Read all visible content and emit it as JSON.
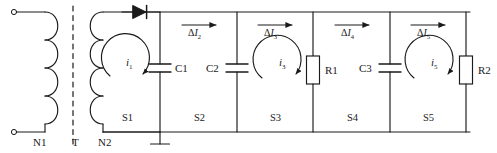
{
  "diagram": {
    "stroke_color": "#1a1a1a",
    "terminals": [
      {
        "name": "primary-winding-label",
        "text": "N1",
        "x": 33,
        "y": 136
      },
      {
        "name": "transformer-core-label",
        "text": "T",
        "x": 72,
        "y": 136
      },
      {
        "name": "secondary-winding-label",
        "text": "N2",
        "x": 98,
        "y": 136
      }
    ],
    "components": [
      {
        "name": "capacitor-c1",
        "text": "C1",
        "x": 175,
        "y": 64
      },
      {
        "name": "capacitor-c2",
        "text": "C2",
        "x": 208,
        "y": 64
      },
      {
        "name": "resistor-r1",
        "text": "R1",
        "x": 327,
        "y": 68
      },
      {
        "name": "capacitor-c3",
        "text": "C3",
        "x": 362,
        "y": 64
      },
      {
        "name": "resistor-r2",
        "text": "R2",
        "x": 478,
        "y": 68
      }
    ],
    "sections": [
      {
        "name": "section-s1",
        "text": "S1",
        "x": 122,
        "y": 114
      },
      {
        "name": "section-s2",
        "text": "S2",
        "x": 196,
        "y": 114
      },
      {
        "name": "section-s3",
        "text": "S3",
        "x": 272,
        "y": 114
      },
      {
        "name": "section-s4",
        "text": "S4",
        "x": 348,
        "y": 114
      },
      {
        "name": "section-s5",
        "text": "S5",
        "x": 425,
        "y": 114
      }
    ],
    "loop_currents": [
      {
        "name": "loop-current-i1",
        "symbol": "i",
        "subscript": "1",
        "x": 127,
        "y": 62
      },
      {
        "name": "loop-current-i3",
        "symbol": "i",
        "subscript": "3",
        "x": 280,
        "y": 62
      },
      {
        "name": "loop-current-i5",
        "symbol": "i",
        "subscript": "5",
        "x": 432,
        "y": 62
      }
    ],
    "delta_currents": [
      {
        "name": "delta-current-i2",
        "prefix": "Δ",
        "symbol": "I",
        "subscript": "2",
        "x": 199,
        "y": 27
      },
      {
        "name": "delta-current-i3",
        "prefix": "Δ",
        "symbol": "I",
        "subscript": "3",
        "x": 275,
        "y": 27
      },
      {
        "name": "delta-current-i4",
        "prefix": "Δ",
        "symbol": "I",
        "subscript": "4",
        "x": 352,
        "y": 27
      },
      {
        "name": "delta-current-i5",
        "prefix": "Δ",
        "symbol": "I",
        "subscript": "5",
        "x": 428,
        "y": 27
      }
    ],
    "icons": {
      "diode": "diode-icon",
      "ground": "ground-icon",
      "terminal_top": "terminal-node-icon",
      "terminal_bottom": "terminal-node-icon"
    }
  }
}
